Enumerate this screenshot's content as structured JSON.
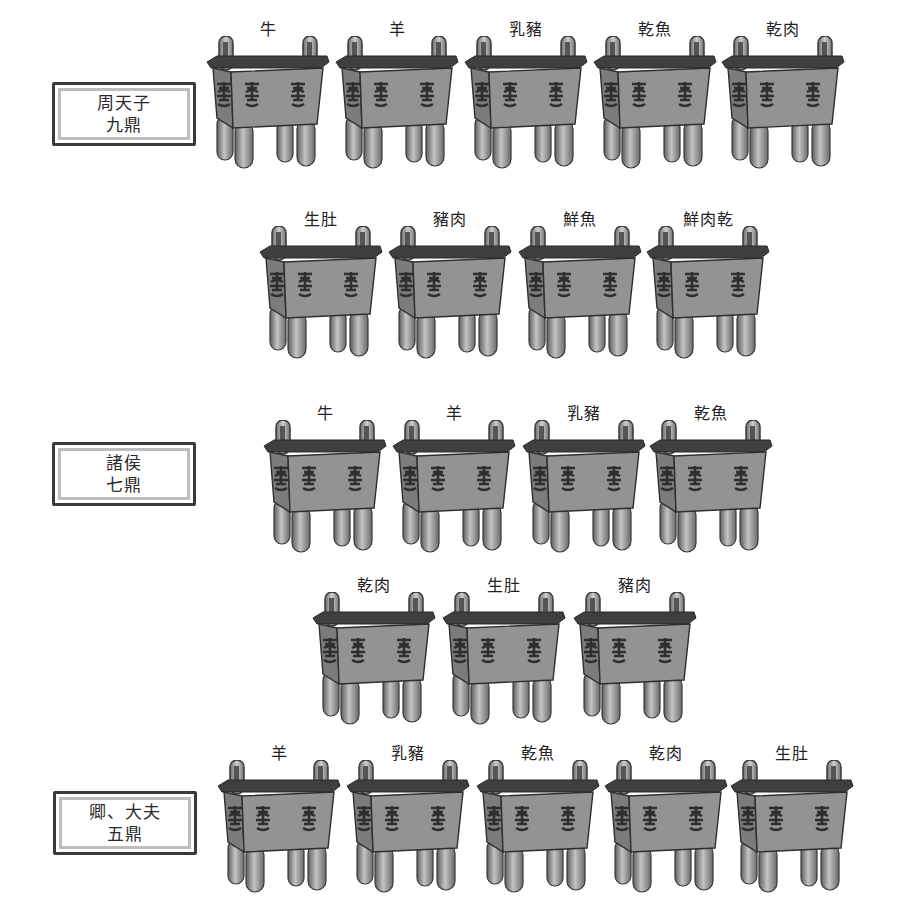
{
  "colors": {
    "bronze_body": "#8c8c8c",
    "bronze_dark": "#3c3c3c",
    "bronze_rim": "#4a4a4a",
    "leg_light": "#b5b5b5",
    "box_border": "#3a3a3a",
    "box_inner_border": "#bdbdbd"
  },
  "ranks": [
    {
      "rank": "周天子",
      "count_label": "九鼎",
      "vessels": [
        "牛",
        "羊",
        "乳豬",
        "乾魚",
        "乾肉",
        "生肚",
        "豬肉",
        "鮮魚",
        "鮮肉乾"
      ]
    },
    {
      "rank": "諸侯",
      "count_label": "七鼎",
      "vessels": [
        "牛",
        "羊",
        "乳豬",
        "乾魚",
        "乾肉",
        "生肚",
        "豬肉"
      ]
    },
    {
      "rank": "卿、大夫",
      "count_label": "五鼎",
      "vessels": [
        "羊",
        "乳豬",
        "乾魚",
        "乾肉",
        "生肚"
      ]
    }
  ],
  "icon": "ding-vessel-icon"
}
